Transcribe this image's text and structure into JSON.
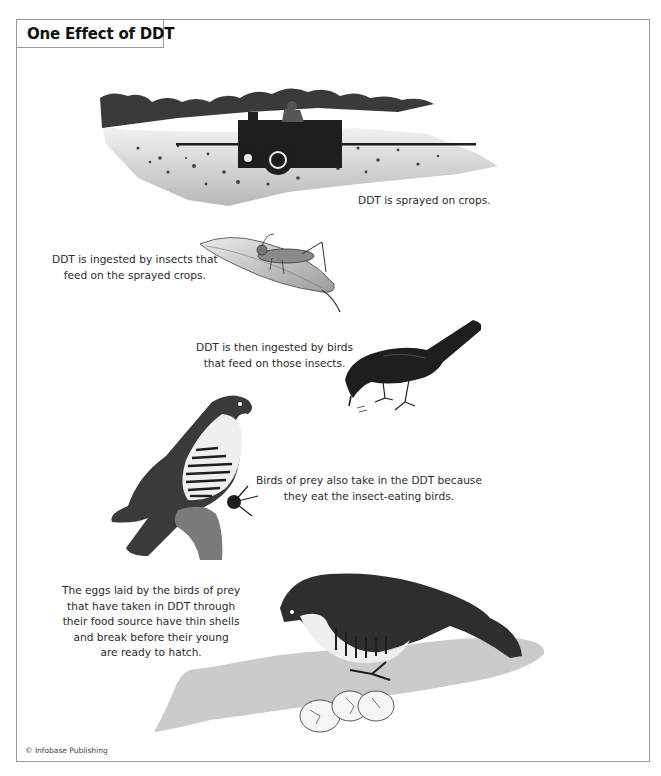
{
  "title": "One Effect of DDT",
  "steps": [
    {
      "id": "spraying",
      "caption_lines": [
        "DDT is sprayed on crops."
      ],
      "illustration": "tractor-spraying-field"
    },
    {
      "id": "insects",
      "caption_lines": [
        "DDT is ingested by insects that",
        "feed on the sprayed crops."
      ],
      "illustration": "grasshopper-on-leaf"
    },
    {
      "id": "birds",
      "caption_lines": [
        "DDT is then ingested by birds",
        "that feed on those insects."
      ],
      "illustration": "blackbird-eating-insect"
    },
    {
      "id": "birds-of-prey",
      "caption_lines": [
        "Birds of prey also take in the DDT because",
        "they eat the insect-eating birds."
      ],
      "illustration": "falcon-perched-with-prey"
    },
    {
      "id": "eggs",
      "caption_lines": [
        "The eggs laid by the birds of prey",
        "that have taken in DDT through",
        "their food source have thin shells",
        "and break before their young",
        "are ready to hatch."
      ],
      "illustration": "falcon-with-cracked-eggs"
    }
  ],
  "credit": "© Infobase Publishing",
  "colors": {
    "frame": "#9a9a9a",
    "ink": "#1e1e1e",
    "ground": "#c8c8c8",
    "text": "#2a2a2a"
  }
}
